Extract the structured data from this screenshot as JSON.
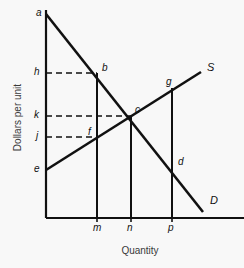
{
  "figure": {
    "kind": "supply-demand-diagram",
    "background_color": "#f8f8f8",
    "line_color": "#111111",
    "dash_color": "#111111"
  },
  "axes": {
    "y_title": "Dollars per unit",
    "x_title": "Quantity",
    "origin": {
      "x": 46,
      "y": 218
    },
    "y_top": 10,
    "x_right": 244
  },
  "curves": [
    {
      "name": "demand",
      "label": "D",
      "label_x": 210,
      "label_y": 194,
      "x1": 46,
      "y1": 14,
      "x2": 203,
      "y2": 212
    },
    {
      "name": "supply",
      "label": "S",
      "label_x": 207,
      "label_y": 61,
      "x1": 46,
      "y1": 170,
      "x2": 201,
      "y2": 72
    }
  ],
  "price_ticks": [
    {
      "label": "a",
      "y": 14,
      "label_x": 36,
      "label_y": 7
    },
    {
      "label": "h",
      "y": 73,
      "label_x": 34,
      "label_y": 66
    },
    {
      "label": "k",
      "y": 116,
      "label_x": 34,
      "label_y": 109
    },
    {
      "label": "j",
      "y": 137,
      "label_x": 36,
      "label_y": 130
    },
    {
      "label": "e",
      "y": 170,
      "label_x": 34,
      "label_y": 163
    }
  ],
  "quantity_ticks": [
    {
      "label": "m",
      "x": 97,
      "label_x": 93,
      "label_y": 222
    },
    {
      "label": "n",
      "x": 131,
      "label_x": 127,
      "label_y": 222
    },
    {
      "label": "p",
      "x": 172,
      "label_x": 168,
      "label_y": 222
    }
  ],
  "points": [
    {
      "label": "b",
      "x": 97,
      "y": 73,
      "label_x": 102,
      "label_y": 62
    },
    {
      "label": "c",
      "x": 131,
      "y": 116,
      "label_x": 135,
      "label_y": 104
    },
    {
      "label": "f",
      "x": 97,
      "y": 137,
      "label_x": 88,
      "label_y": 126
    },
    {
      "label": "g",
      "x": 172,
      "y": 88,
      "label_x": 166,
      "label_y": 76
    },
    {
      "label": "d",
      "x": 172,
      "y": 163,
      "label_x": 178,
      "label_y": 156
    }
  ],
  "dashed_segments": [
    {
      "name": "h-to-b",
      "x1": 46,
      "y1": 73,
      "x2": 97,
      "y2": 73
    },
    {
      "name": "k-to-c",
      "x1": 46,
      "y1": 116,
      "x2": 131,
      "y2": 116
    },
    {
      "name": "j-to-f",
      "x1": 46,
      "y1": 137,
      "x2": 97,
      "y2": 137
    }
  ],
  "vertical_drops": [
    {
      "name": "m-drop",
      "x": 97,
      "y_top": 73,
      "y_bottom": 218
    },
    {
      "name": "n-drop",
      "x": 131,
      "y_top": 116,
      "y_bottom": 218
    },
    {
      "name": "p-drop",
      "x": 172,
      "y_top": 88,
      "y_bottom": 218
    }
  ],
  "chart_data": {
    "type": "line",
    "title": "",
    "xlabel": "Quantity",
    "ylabel": "Dollars per unit",
    "grid": false,
    "legend": "inline-curve-labels",
    "xlim": [
      0,
      1
    ],
    "ylim": [
      0,
      1
    ],
    "series": [
      {
        "name": "D",
        "description": "Downward-sloping demand curve from intercept a on the price axis to the lower right",
        "points": [
          {
            "label": "a",
            "x": 0.0,
            "y": 1.0
          },
          {
            "label": "b",
            "x": 0.26,
            "y": 0.71
          },
          {
            "label": "c",
            "x": 0.43,
            "y": 0.5
          },
          {
            "label": "d",
            "x": 0.64,
            "y": 0.27
          }
        ]
      },
      {
        "name": "S",
        "description": "Upward-sloping supply curve from intercept e on the price axis to the upper right",
        "points": [
          {
            "label": "e",
            "x": 0.0,
            "y": 0.24
          },
          {
            "label": "f",
            "x": 0.26,
            "y": 0.4
          },
          {
            "label": "c",
            "x": 0.43,
            "y": 0.5
          },
          {
            "label": "g",
            "x": 0.64,
            "y": 0.64
          }
        ]
      }
    ],
    "price_tick_labels": [
      "a",
      "h",
      "k",
      "j",
      "e"
    ],
    "quantity_tick_labels": [
      "m",
      "n",
      "p"
    ],
    "equilibrium": {
      "label": "c",
      "quantity_label": "n",
      "price_label": "k"
    },
    "annotations": [
      "b lies on D above quantity m at price h",
      "f lies on S above quantity m at price j",
      "c is the equilibrium at quantity n and price k",
      "g lies on S above quantity p",
      "d lies on D above quantity p"
    ]
  }
}
